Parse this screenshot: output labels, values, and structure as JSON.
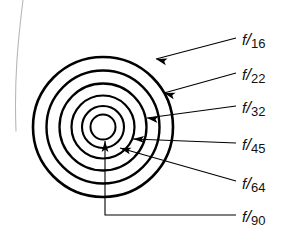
{
  "figure": {
    "background_color": "#ffffff",
    "line_color": "#000000",
    "artifact_curve": {
      "name": "scan-edge-curve",
      "color": "#b8b8b8",
      "path": "M 23 0 C 18 40, 14 80, 16 131"
    },
    "center": {
      "x": 103,
      "y": 127
    },
    "rings": [
      {
        "id": "ring-f16",
        "label": "f/16",
        "radius": 70,
        "stroke_width": 2.6
      },
      {
        "id": "ring-f22",
        "label": "f/22",
        "radius": 56.5,
        "stroke_width": 2.4
      },
      {
        "id": "ring-f32",
        "label": "f/32",
        "radius": 43.5,
        "stroke_width": 2.3
      },
      {
        "id": "ring-f45",
        "label": "f/45",
        "radius": 31.5,
        "stroke_width": 2.2
      },
      {
        "id": "ring-f64",
        "label": "f/64",
        "radius": 21,
        "stroke_width": 2.1
      },
      {
        "id": "ring-f90",
        "label": "f/90",
        "radius": 12.5,
        "stroke_width": 2.0
      }
    ],
    "labels": [
      {
        "id": "label-f16",
        "prefix": "f",
        "slash": "/",
        "number": "16",
        "x": 242,
        "y": 31
      },
      {
        "id": "label-f22",
        "prefix": "f",
        "slash": "/",
        "number": "22",
        "x": 242,
        "y": 66
      },
      {
        "id": "label-f32",
        "prefix": "f",
        "slash": "/",
        "number": "32",
        "x": 242,
        "y": 99
      },
      {
        "id": "label-f45",
        "prefix": "f",
        "slash": "/",
        "number": "45",
        "x": 242,
        "y": 136
      },
      {
        "id": "label-f64",
        "prefix": "f",
        "slash": "/",
        "number": "64",
        "x": 242,
        "y": 175
      },
      {
        "id": "label-f90",
        "prefix": "f",
        "slash": "/",
        "number": "90",
        "x": 242,
        "y": 208
      }
    ],
    "leaders": [
      {
        "id": "leader-f16",
        "for": "f/16",
        "path": "M 236 38 L 156 59",
        "arrow_at": {
          "x": 156,
          "y": 59
        },
        "angle": 195
      },
      {
        "id": "leader-f22",
        "for": "f/22",
        "path": "M 236 73 L 164 93",
        "arrow_at": {
          "x": 164,
          "y": 93
        },
        "angle": 196
      },
      {
        "id": "leader-f32",
        "for": "f/32",
        "path": "M 236 106 L 147 118",
        "arrow_at": {
          "x": 147,
          "y": 118
        },
        "angle": 188
      },
      {
        "id": "leader-f45",
        "for": "f/45",
        "path": "M 236 143 L 133 139",
        "arrow_at": {
          "x": 133,
          "y": 139
        },
        "angle": 182
      },
      {
        "id": "leader-f64",
        "for": "f/64",
        "path": "M 236 181 L 120 148",
        "arrow_at": {
          "x": 120,
          "y": 148
        },
        "angle": 196
      },
      {
        "id": "leader-f90",
        "for": "f/90",
        "path": "M 236 215 L 105 215 L 105 141",
        "arrow_at": {
          "x": 105,
          "y": 141
        },
        "angle": 270
      }
    ]
  }
}
